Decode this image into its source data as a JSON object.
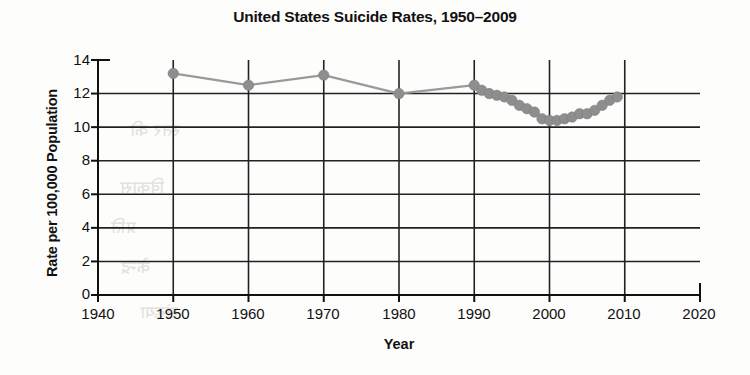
{
  "chart_data": {
    "type": "line",
    "title": "United States Suicide Rates, 1950–2009",
    "xlabel": "Year",
    "ylabel": "Rate per 100,000 Population",
    "xlim": [
      1940,
      2020
    ],
    "ylim": [
      0,
      14
    ],
    "xticks": [
      1940,
      1950,
      1960,
      1970,
      1980,
      1990,
      2000,
      2010,
      2020
    ],
    "yticks": [
      0,
      2,
      4,
      6,
      8,
      10,
      12,
      14
    ],
    "grid": "both",
    "legend": "none",
    "series": [
      {
        "name": "US suicide rate per 100,000 population",
        "marker": "circle",
        "color": "#8e8e8e",
        "x": [
          1950,
          1960,
          1970,
          1980,
          1990,
          1991,
          1992,
          1993,
          1994,
          1995,
          1996,
          1997,
          1998,
          1999,
          2000,
          2001,
          2002,
          2003,
          2004,
          2005,
          2006,
          2007,
          2008,
          2009
        ],
        "values": [
          13.2,
          12.5,
          13.1,
          12.0,
          12.5,
          12.2,
          12.0,
          11.9,
          11.8,
          11.6,
          11.3,
          11.1,
          10.9,
          10.5,
          10.4,
          10.4,
          10.5,
          10.6,
          10.8,
          10.8,
          11.0,
          11.3,
          11.6,
          11.8
        ]
      }
    ],
    "annotations": []
  },
  "figure": {
    "title": "United States Suicide Rates, 1950–2009",
    "axis": {
      "x_title": "Year",
      "y_title": "Rate per 100,000 Population"
    },
    "colors": {
      "marker": "#8e8e8e",
      "line": "#9a9a9a",
      "axis": "#111111",
      "grid": "#222222",
      "background": "#fdfdfc"
    },
    "ticks": {
      "y": [
        "14",
        "12",
        "10",
        "8",
        "6",
        "4",
        "2",
        "0"
      ],
      "x": [
        "1940",
        "1950",
        "1960",
        "1970",
        "1980",
        "1990",
        "2000",
        "2010",
        "2020"
      ]
    }
  },
  "bleed_through": {
    "line1": "स्तर की",
    "line2": "विकास",
    "line3": "प्रति",
    "line4": "केन्द्र",
    "line5": "संख्या"
  }
}
